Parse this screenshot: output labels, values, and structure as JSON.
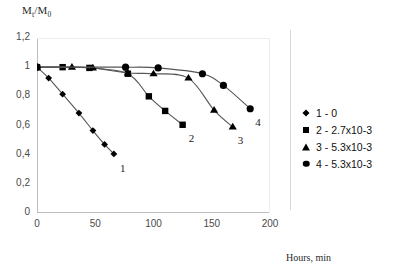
{
  "axes": {
    "ylabel_main": "M",
    "ylabel_sub1": "t",
    "ylabel_slash": "/M",
    "ylabel_sub2": "0",
    "ylabel_full": "Mt/M0",
    "xtitle": "Hours, min",
    "yticks": [
      "1,2",
      "1",
      "0,8",
      "0,6",
      "0,4",
      "0,2",
      "0"
    ],
    "xticks": [
      "0",
      "50",
      "100",
      "150",
      "200"
    ]
  },
  "curve_labels": {
    "c1": "1",
    "c2": "2",
    "c3": "3",
    "c4": "4"
  },
  "legend": {
    "items": [
      {
        "marker": "diamond-marker",
        "label": "1 - 0"
      },
      {
        "marker": "square-marker",
        "label": "2 - 2.7x10-3"
      },
      {
        "marker": "triangle-marker",
        "label": "3 - 5.3x10-3"
      },
      {
        "marker": "circle-marker",
        "label": "4 - 5.3x10-3"
      }
    ]
  },
  "chart_data": {
    "type": "line",
    "title": "",
    "xlabel": "Hours, min",
    "ylabel": "Mt/M0",
    "xlim": [
      0,
      200
    ],
    "ylim": [
      0,
      1.2
    ],
    "xticks": [
      0,
      50,
      100,
      150,
      200
    ],
    "yticks": [
      0,
      0.2,
      0.4,
      0.6,
      0.8,
      1.0,
      1.2
    ],
    "grid": false,
    "legend_position": "right",
    "decimal_separator": ",",
    "marker_color": "#000000",
    "line_color": "#555555",
    "series": [
      {
        "name": "1 - 0",
        "marker": "diamond",
        "end_label": "1",
        "x": [
          0,
          10,
          22,
          36,
          48,
          58,
          66
        ],
        "y": [
          1.0,
          0.925,
          0.815,
          0.685,
          0.565,
          0.47,
          0.405
        ]
      },
      {
        "name": "2 - 2.7x10-3",
        "marker": "square",
        "end_label": "2",
        "x": [
          0,
          22,
          45,
          78,
          96,
          110,
          125
        ],
        "y": [
          1.0,
          1.0,
          0.995,
          0.955,
          0.8,
          0.7,
          0.605
        ]
      },
      {
        "name": "3 - 5.3x10-3",
        "marker": "triangle",
        "end_label": "3",
        "x": [
          0,
          30,
          48,
          78,
          100,
          130,
          152,
          168
        ],
        "y": [
          1.0,
          1.0,
          0.995,
          0.96,
          0.955,
          0.925,
          0.705,
          0.59
        ]
      },
      {
        "name": "4 - 5.3x10-3",
        "marker": "circle",
        "end_label": "4",
        "x": [
          0,
          76,
          104,
          142,
          160,
          183
        ],
        "y": [
          1.0,
          1.0,
          0.995,
          0.955,
          0.875,
          0.715
        ]
      }
    ]
  }
}
